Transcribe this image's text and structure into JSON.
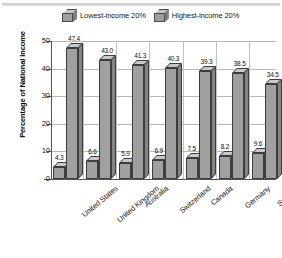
{
  "chart_data": {
    "type": "bar",
    "title": "",
    "xlabel": "",
    "ylabel": "Percentage of National Income",
    "ylim": [
      0,
      50
    ],
    "yticks": [
      "0",
      "10",
      "20",
      "30",
      "40",
      "50"
    ],
    "grid": true,
    "legend_position": "top",
    "categories": [
      "United States",
      "United Kingdom",
      "Australia",
      "Switzerland",
      "Canada",
      "Germany",
      "Sweden"
    ],
    "series": [
      {
        "name": "Lowest-income 20%",
        "values": [
          4.3,
          6.6,
          5.9,
          6.9,
          7.5,
          8.2,
          9.6
        ],
        "color": "#a0a0a0"
      },
      {
        "name": "Highest-income 20%",
        "values": [
          47.4,
          43.0,
          41.3,
          40.3,
          39.3,
          38.5,
          34.5
        ],
        "color": "#a0a0a0"
      }
    ],
    "value_labels": {
      "lowest": [
        "4.3",
        "6.6",
        "5.9",
        "6.9",
        "7.5",
        "8.2",
        "9.6"
      ],
      "highest": [
        "47.4",
        "43.0",
        "41.3",
        "40.3",
        "39.3",
        "38.5",
        "34.5"
      ]
    }
  },
  "legend": {
    "items": [
      {
        "label": "Lowest-income 20%"
      },
      {
        "label": "Highest-income 20%"
      }
    ]
  },
  "axis": {
    "ylabel": "Percentage of National Income"
  }
}
